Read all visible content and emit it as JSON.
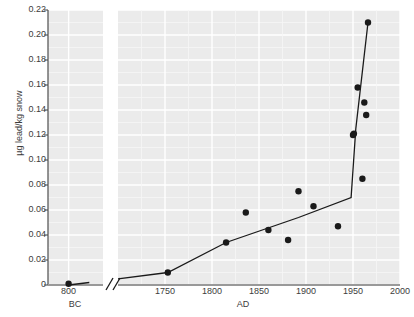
{
  "chart_data": {
    "type": "scatter",
    "title": "",
    "subtitle": "",
    "xlabel_left": "BC",
    "xlabel_right": "AD",
    "ylabel": "µg lead/kg snow",
    "ylim": [
      0,
      0.22
    ],
    "yticks": [
      0,
      0.02,
      0.04,
      0.06,
      0.08,
      0.1,
      0.12,
      0.14,
      0.16,
      0.18,
      0.2,
      0.22
    ],
    "ytick_labels": [
      "0",
      "0.02",
      "0.04",
      "0.06",
      "0.08",
      "0.10",
      "0.12",
      "0.14",
      "0.16",
      "0.18",
      "0.20",
      "0.22"
    ],
    "xticks_left": [
      800
    ],
    "xtick_labels_left": [
      "800"
    ],
    "xticks_right": [
      1750,
      1800,
      1850,
      1900,
      1950,
      2000
    ],
    "xtick_labels_right": [
      "1750",
      "1800",
      "1850",
      "1900",
      "1950",
      "2000"
    ],
    "axis_break": true,
    "axis_break_symbol": "//",
    "grid": true,
    "grid_color": "#ffffff",
    "panel_background": "#ebebeb",
    "marker_color": "#1a1a1a",
    "line_color": "#1a1a1a",
    "legend": "none",
    "points": [
      {
        "x": 800,
        "y": 0.001,
        "era": "BC",
        "panel": "left"
      },
      {
        "x": 1753,
        "y": 0.01,
        "era": "AD",
        "panel": "right"
      },
      {
        "x": 1815,
        "y": 0.034,
        "era": "AD",
        "panel": "right"
      },
      {
        "x": 1836,
        "y": 0.058,
        "era": "AD",
        "panel": "right"
      },
      {
        "x": 1860,
        "y": 0.044,
        "era": "AD",
        "panel": "right"
      },
      {
        "x": 1881,
        "y": 0.036,
        "era": "AD",
        "panel": "right"
      },
      {
        "x": 1892,
        "y": 0.075,
        "era": "AD",
        "panel": "right"
      },
      {
        "x": 1908,
        "y": 0.063,
        "era": "AD",
        "panel": "right"
      },
      {
        "x": 1934,
        "y": 0.047,
        "era": "AD",
        "panel": "right"
      },
      {
        "x": 1950,
        "y": 0.12,
        "era": "AD",
        "panel": "right"
      },
      {
        "x": 1951,
        "y": 0.121,
        "era": "AD",
        "panel": "right"
      },
      {
        "x": 1955,
        "y": 0.158,
        "era": "AD",
        "panel": "right"
      },
      {
        "x": 1960,
        "y": 0.085,
        "era": "AD",
        "panel": "right"
      },
      {
        "x": 1962,
        "y": 0.146,
        "era": "AD",
        "panel": "right"
      },
      {
        "x": 1964,
        "y": 0.136,
        "era": "AD",
        "panel": "right"
      },
      {
        "x": 1966,
        "y": 0.21,
        "era": "AD",
        "panel": "right"
      }
    ],
    "trend_left": [
      {
        "x": 800,
        "y": 0.0
      },
      {
        "x": 1100,
        "y": 0.002
      }
    ],
    "trend_right": [
      {
        "x": 1700,
        "y": 0.005
      },
      {
        "x": 1753,
        "y": 0.01
      },
      {
        "x": 1815,
        "y": 0.034
      },
      {
        "x": 1892,
        "y": 0.054
      },
      {
        "x": 1948,
        "y": 0.07
      },
      {
        "x": 1953,
        "y": 0.125
      },
      {
        "x": 1966,
        "y": 0.21
      }
    ]
  }
}
